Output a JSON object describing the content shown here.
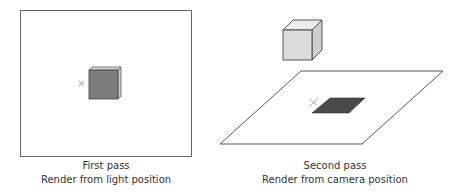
{
  "panels": [
    {
      "id": "first-pass",
      "title": "First pass",
      "subtitle": "Render from light position"
    },
    {
      "id": "second-pass",
      "title": "Second pass",
      "subtitle": "Render from camera position"
    }
  ],
  "colors": {
    "outline": "#555555",
    "cube_front_dark": "#7a7a7a",
    "cube_light": "#d9d9d9",
    "shadow": "#4a4a4a",
    "x_marker": "#bbbbbb"
  },
  "icons": {
    "marker": "x-mark"
  }
}
